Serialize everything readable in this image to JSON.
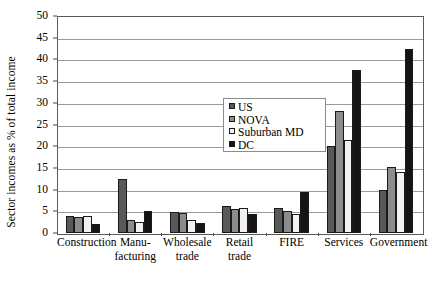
{
  "chart_data": {
    "type": "bar",
    "title": "",
    "subtitle": "",
    "xlabel": "",
    "ylabel": "Sector incomes as % of total income",
    "ylim": [
      0,
      50
    ],
    "ytick_step": 5,
    "yticks": [
      0,
      5,
      10,
      15,
      20,
      25,
      30,
      35,
      40,
      45,
      50
    ],
    "ytick_labels": [
      "0",
      "5",
      "10",
      "15",
      "20",
      "25",
      "30",
      "35",
      "40",
      "45",
      "50"
    ],
    "grid": "horizontal",
    "legend_position": "inside-center-upper",
    "categories": [
      "Construction",
      "Manu-\nfacturing",
      "Wholesale\ntrade",
      "Retail\ntrade",
      "FIRE",
      "Services",
      "Government"
    ],
    "series": [
      {
        "name": "US",
        "color": "#595959",
        "values": [
          4.0,
          12.5,
          4.8,
          6.3,
          5.8,
          20.0,
          10.0
        ]
      },
      {
        "name": "NOVA",
        "color": "#8c8c8c",
        "values": [
          3.8,
          3.0,
          4.7,
          5.5,
          5.0,
          28.0,
          15.3
        ]
      },
      {
        "name": "Suburban MD",
        "color": "#f2f2f2",
        "values": [
          4.0,
          2.5,
          3.0,
          5.7,
          4.3,
          21.5,
          14.0
        ]
      },
      {
        "name": "DC",
        "color": "#141414",
        "values": [
          2.0,
          5.0,
          2.2,
          4.3,
          9.5,
          37.5,
          42.5
        ]
      }
    ]
  },
  "legend": {
    "items": [
      {
        "label": "US"
      },
      {
        "label": "NOVA"
      },
      {
        "label": "Suburban MD"
      },
      {
        "label": "DC"
      }
    ]
  }
}
